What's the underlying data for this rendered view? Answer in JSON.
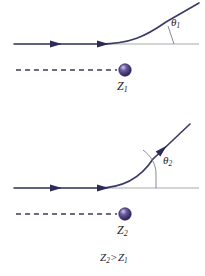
{
  "figure": {
    "background_color": "#ffffff",
    "width": 205,
    "height": 276
  },
  "colors": {
    "trajectory": "#3a3a66",
    "axis": "#aaaaaa",
    "nucleus_core": "#4a3a78",
    "nucleus_edge": "#2e2550",
    "nucleus_highlight": "#cfc6e6",
    "text": "#1b1b2e"
  },
  "panels": [
    {
      "id": "panel-top",
      "name": "low-charge-scattering",
      "angle_label": {
        "symbol": "θ",
        "subscript": "1",
        "x": 171,
        "y": 22
      },
      "nucleus_label": {
        "symbol": "Z",
        "subscript": "1",
        "x": 116,
        "y": 80
      },
      "nucleus": {
        "cx": 125,
        "cy": 70,
        "r": 6
      },
      "axis": {
        "x1": 14,
        "y1": 44,
        "x2": 199,
        "y2": 44
      },
      "incoming_arrows": [
        {
          "x": 56,
          "y": 44
        },
        {
          "x": 103,
          "y": 44
        }
      ],
      "trajectory_path": "M 14 44 L 100 44 C 130 44 146 36 166 22 L 199 3",
      "angle_marker_path": "M 174 44 L 168 27",
      "dashed_line": {
        "x1": 16,
        "y1": 70,
        "x2": 118,
        "y2": 70
      }
    },
    {
      "id": "panel-bottom",
      "name": "high-charge-scattering",
      "angle_label": {
        "symbol": "θ",
        "subscript": "2",
        "x": 163,
        "y": 160
      },
      "nucleus_label": {
        "symbol": "Z",
        "subscript": "2",
        "x": 116,
        "y": 224
      },
      "nucleus": {
        "cx": 125,
        "cy": 214,
        "r": 6
      },
      "axis": {
        "x1": 14,
        "y1": 188,
        "x2": 199,
        "y2": 188
      },
      "incoming_arrows": [
        {
          "x": 56,
          "y": 188
        },
        {
          "x": 103,
          "y": 188
        }
      ],
      "outgoing_arrow": {
        "x": 163,
        "y": 158,
        "angle": -58
      },
      "trajectory_path": "M 14 188 L 98 188 C 124 188 140 178 152 160 L 190 124",
      "angle_marker_path": "M 155 188 L 155 176 C 155 166 150 158 142 152",
      "dashed_line": {
        "x1": 16,
        "y1": 214,
        "x2": 118,
        "y2": 214
      }
    }
  ],
  "comparison": {
    "text_left_symbol": "Z",
    "text_left_sub": "2",
    "operator": ">",
    "text_right_symbol": "Z",
    "text_right_sub": "1",
    "x": 100,
    "y": 254
  }
}
